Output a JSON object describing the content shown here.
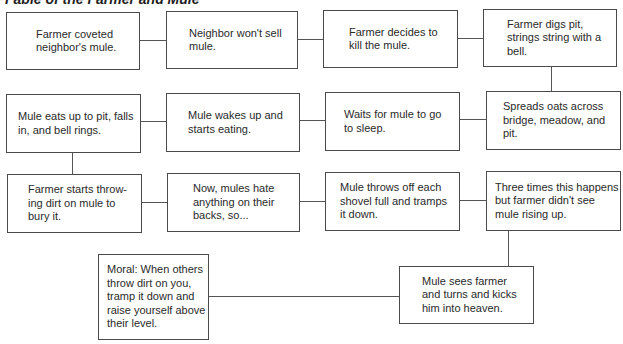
{
  "diagram": {
    "title": "Fable of the Farmer and Mule",
    "type": "flowchart",
    "colors": {
      "border": "#4a4a4a",
      "text": "#2a2a2a",
      "background": "#ffffff"
    },
    "rows": [
      {
        "boxes": [
          {
            "id": "b1",
            "text": "Farmer coveted\nneighbor's mule."
          },
          {
            "id": "b2",
            "text": "Neighbor won't sell\nmule."
          },
          {
            "id": "b3",
            "text": "Farmer decides to\nkill the mule."
          },
          {
            "id": "b4",
            "text": "Farmer digs pit,\nstrings string with a\nbell."
          }
        ]
      },
      {
        "boxes": [
          {
            "id": "b8",
            "text": "Mule eats up to pit, falls\nin, and bell rings."
          },
          {
            "id": "b7",
            "text": "Mule wakes up and\nstarts eating."
          },
          {
            "id": "b6",
            "text": "Waits for mule to go\nto sleep."
          },
          {
            "id": "b5",
            "text": "Spreads oats across\nbridge, meadow, and\npit."
          }
        ]
      },
      {
        "boxes": [
          {
            "id": "b9",
            "text": "Farmer starts throw-\ning dirt on mule to\nbury it."
          },
          {
            "id": "b10",
            "text": "Now, mules hate\nanything on their\nbacks, so..."
          },
          {
            "id": "b11",
            "text": "Mule throws off each\nshovel full and tramps\nit down."
          },
          {
            "id": "b12",
            "text": "Three times this happens\nbut farmer didn't see\nmule rising up."
          }
        ]
      },
      {
        "boxes": [
          {
            "id": "b14",
            "text": "Moral: When others\nthrow dirt on you,\ntramp it down and\nraise yourself above\ntheir level."
          },
          {
            "id": "b13",
            "text": "Mule sees farmer\nand turns and kicks\nhim into heaven."
          }
        ]
      }
    ],
    "flow_order": [
      "b1",
      "b2",
      "b3",
      "b4",
      "b5",
      "b6",
      "b7",
      "b8",
      "b9",
      "b10",
      "b11",
      "b12",
      "b13",
      "b14"
    ]
  }
}
